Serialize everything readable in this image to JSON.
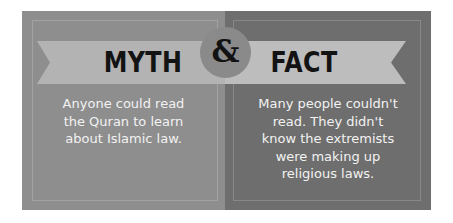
{
  "graphic": {
    "type": "myth-vs-fact-comparison",
    "background_color": "#ffffff"
  },
  "connector": {
    "symbol": "&",
    "icon_name": "ampersand-medallion",
    "circle_color": "#8a8a8a",
    "glyph_color": "#121212"
  },
  "panels": [
    {
      "id": "myth",
      "heading": "MYTH",
      "body": "Anyone could read\nthe Quran to learn\nabout Islamic law.",
      "panel_color": "#8e8e8e",
      "ribbon_color": "#b3b3b3",
      "heading_color": "#131313",
      "body_color": "#f2f2f2"
    },
    {
      "id": "fact",
      "heading": "FACT",
      "body": "Many people couldn't\nread. They didn't\nknow the extremists\nwere making up\nreligious laws.",
      "panel_color": "#6e6e6e",
      "ribbon_color": "#bdbdbd",
      "heading_color": "#131313",
      "body_color": "#f2f2f2"
    }
  ]
}
